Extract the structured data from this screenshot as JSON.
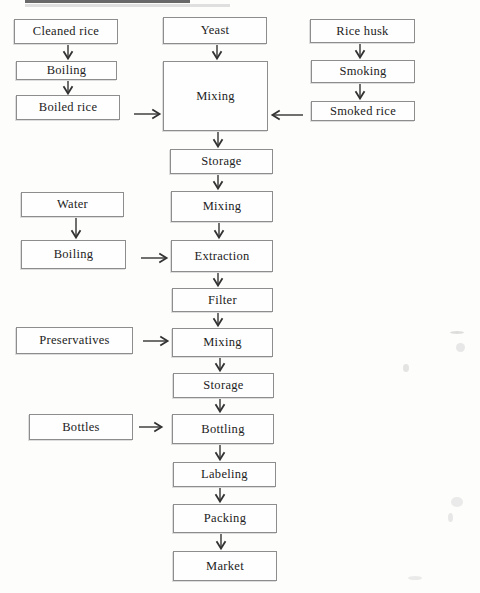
{
  "diagram_type": "flowchart",
  "colors": {
    "box_border": "#8d8d8d",
    "text": "#222222",
    "arrow": "#333333",
    "background": "#fdfdfc"
  },
  "nodes": {
    "cleaned_rice": {
      "label": "Cleaned rice"
    },
    "boiling_1": {
      "label": "Boiling"
    },
    "boiled_rice": {
      "label": "Boiled rice"
    },
    "yeast": {
      "label": "Yeast"
    },
    "mixing_1": {
      "label": "Mixing"
    },
    "storage_1": {
      "label": "Storage"
    },
    "mixing_2": {
      "label": "Mixing"
    },
    "extraction": {
      "label": "Extraction"
    },
    "filter": {
      "label": "Filter"
    },
    "mixing_3": {
      "label": "Mixing"
    },
    "storage_2": {
      "label": "Storage"
    },
    "bottling": {
      "label": "Bottling"
    },
    "labeling": {
      "label": "Labeling"
    },
    "packing": {
      "label": "Packing"
    },
    "market": {
      "label": "Market"
    },
    "rice_husk": {
      "label": "Rice husk"
    },
    "smoking": {
      "label": "Smoking"
    },
    "smoked_rice": {
      "label": "Smoked rice"
    },
    "water": {
      "label": "Water"
    },
    "boiling_2": {
      "label": "Boiling"
    },
    "preservatives": {
      "label": "Preservatives"
    },
    "bottles": {
      "label": "Bottles"
    }
  },
  "edges": [
    {
      "from": "cleaned_rice",
      "to": "boiling_1"
    },
    {
      "from": "boiling_1",
      "to": "boiled_rice"
    },
    {
      "from": "boiled_rice",
      "to": "mixing_1"
    },
    {
      "from": "yeast",
      "to": "mixing_1"
    },
    {
      "from": "rice_husk",
      "to": "smoking"
    },
    {
      "from": "smoking",
      "to": "smoked_rice"
    },
    {
      "from": "smoked_rice",
      "to": "mixing_1"
    },
    {
      "from": "mixing_1",
      "to": "storage_1"
    },
    {
      "from": "storage_1",
      "to": "mixing_2"
    },
    {
      "from": "mixing_2",
      "to": "extraction"
    },
    {
      "from": "water",
      "to": "boiling_2"
    },
    {
      "from": "boiling_2",
      "to": "extraction"
    },
    {
      "from": "extraction",
      "to": "filter"
    },
    {
      "from": "filter",
      "to": "mixing_3"
    },
    {
      "from": "preservatives",
      "to": "mixing_3"
    },
    {
      "from": "mixing_3",
      "to": "storage_2"
    },
    {
      "from": "storage_2",
      "to": "bottling"
    },
    {
      "from": "bottles",
      "to": "bottling"
    },
    {
      "from": "bottling",
      "to": "labeling"
    },
    {
      "from": "labeling",
      "to": "packing"
    },
    {
      "from": "packing",
      "to": "market"
    }
  ]
}
